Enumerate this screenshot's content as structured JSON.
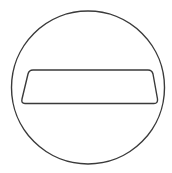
{
  "icon": {
    "name": "no-entry-sign",
    "stroke_color": "#3a3a3a",
    "background_color": "#ffffff"
  }
}
